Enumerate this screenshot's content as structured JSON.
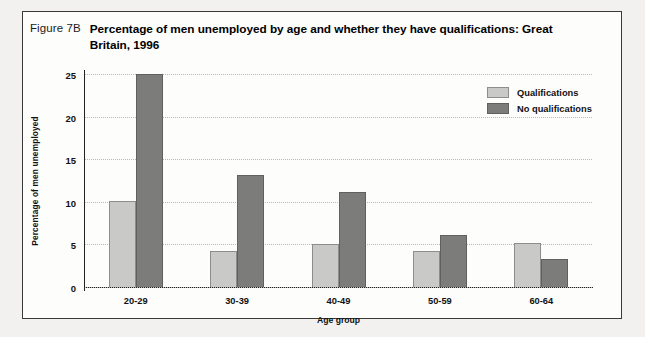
{
  "figure": {
    "label": "Figure 7B",
    "title": "Percentage of men unemployed by age and whether they have qualifications: Great Britain, 1996"
  },
  "chart_data": {
    "type": "bar",
    "title": "Percentage of men unemployed by age and whether they have qualifications: Great Britain, 1996",
    "xlabel": "Age group",
    "ylabel": "Percentage of men unemployed",
    "categories": [
      "20-29",
      "30-39",
      "40-49",
      "50-59",
      "60-64"
    ],
    "series": [
      {
        "name": "Qualifications",
        "color": "#c9c9c7",
        "values": [
          10.1,
          4.2,
          5.1,
          4.2,
          5.2
        ]
      },
      {
        "name": "No qualifications",
        "color": "#7c7c7a",
        "values": [
          25.0,
          13.2,
          11.2,
          6.1,
          3.3
        ]
      }
    ],
    "ylim": [
      0,
      25
    ],
    "yticks": [
      0,
      5,
      10,
      15,
      20,
      25
    ],
    "ytick_labels": [
      "0",
      "5",
      "10",
      "15",
      "20",
      "25"
    ],
    "grid": true,
    "legend_position": "top-right"
  }
}
